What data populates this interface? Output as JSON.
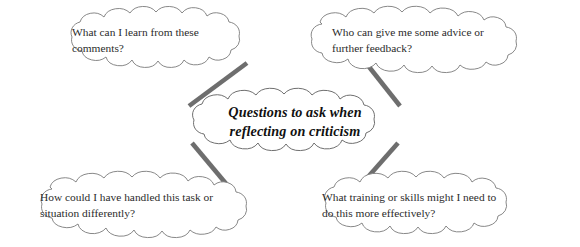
{
  "diagram": {
    "type": "mind-map",
    "background_color": "#ffffff",
    "outline_color": "#777777",
    "connector_color": "#6e6e6e",
    "center": {
      "id": "center-node",
      "lines": [
        "Questions to ask when",
        "reflecting on criticism"
      ],
      "full_text": "Questions to ask when reflecting on criticism",
      "style": "bold-italic-serif",
      "text_color": "#111111"
    },
    "branches": [
      {
        "id": "branch-top-left",
        "position": "top-left",
        "lines": [
          "What can I learn from these",
          "comments?"
        ],
        "full_text": "What can I learn from these comments?",
        "text_color": "#2b2b2b"
      },
      {
        "id": "branch-top-right",
        "position": "top-right",
        "lines": [
          "Who can give me some advice or",
          "further feedback?"
        ],
        "full_text": "Who can give me some advice or further feedback?",
        "text_color": "#2b2b2b"
      },
      {
        "id": "branch-bottom-left",
        "position": "bottom-left",
        "lines": [
          "How could I have handled this task or",
          "situation differently?"
        ],
        "full_text": "How could I have handled this task or situation differently?",
        "text_color": "#2b2b2b"
      },
      {
        "id": "branch-bottom-right",
        "position": "bottom-right",
        "lines": [
          "What training or skills might I need to",
          "do this more effectively?"
        ],
        "full_text": "What training or skills might I need to do this more effectively?",
        "text_color": "#2b2b2b"
      }
    ],
    "connectors": [
      {
        "id": "connector-top-left",
        "from": "center-node",
        "to": "branch-top-left"
      },
      {
        "id": "connector-top-right",
        "from": "center-node",
        "to": "branch-top-right"
      },
      {
        "id": "connector-bottom-left",
        "from": "center-node",
        "to": "branch-bottom-left"
      },
      {
        "id": "connector-bottom-right",
        "from": "center-node",
        "to": "branch-bottom-right"
      }
    ]
  }
}
